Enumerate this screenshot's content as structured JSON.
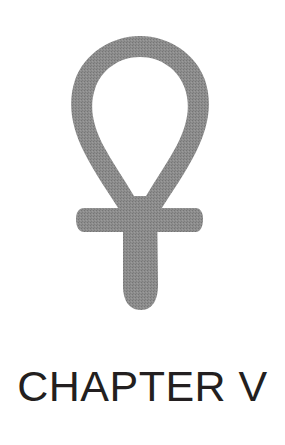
{
  "page": {
    "background_color": "#ffffff",
    "width": 285,
    "height": 445
  },
  "symbol": {
    "name": "ankh",
    "icon_name": "ankh-icon",
    "description": "Egyptian ankh (key of life) symbol",
    "fill_color": "#8a8a8a",
    "texture": "halftone-dither",
    "geometry": {
      "loop_top_y": 36,
      "loop_outer_left_x": 72,
      "loop_outer_right_x": 208,
      "stroke_thickness": 20,
      "crossbar_left_x": 76,
      "crossbar_right_x": 203,
      "crossbar_top_y": 208,
      "crossbar_bottom_y": 232,
      "stem_left_x": 122,
      "stem_right_x": 157,
      "stem_bottom_y": 310,
      "center_x": 140
    }
  },
  "heading": {
    "text": "CHAPTER V",
    "chapter_label": "CHAPTER",
    "chapter_number": "V",
    "color": "#231f20",
    "font_size_px": 43
  }
}
